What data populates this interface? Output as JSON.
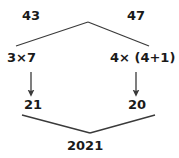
{
  "diagram": {
    "type": "math-flow-diagram",
    "background_color": "#ffffff",
    "stroke_color": "#3a3a3a",
    "text_color": "#1a1a1a",
    "nodes": {
      "top_left": "43",
      "top_right": "47",
      "mid_left": "3×7",
      "mid_right": "4× (4+1)",
      "low_left": "21",
      "low_right": "20",
      "bottom": "2021"
    },
    "edges": [
      {
        "name": "top-left-branch",
        "from": "apex",
        "to": "mid_left",
        "style": "plain-line"
      },
      {
        "name": "top-right-branch",
        "from": "apex",
        "to": "mid_right",
        "style": "plain-line"
      },
      {
        "name": "left-arrow",
        "from": "mid_left",
        "to": "low_left",
        "style": "arrow"
      },
      {
        "name": "right-arrow",
        "from": "mid_right",
        "to": "low_right",
        "style": "arrow"
      },
      {
        "name": "bottom-left-branch",
        "from": "low_left",
        "to": "bottom",
        "style": "plain-line"
      },
      {
        "name": "bottom-right-branch",
        "from": "low_right",
        "to": "bottom",
        "style": "plain-line"
      }
    ]
  }
}
